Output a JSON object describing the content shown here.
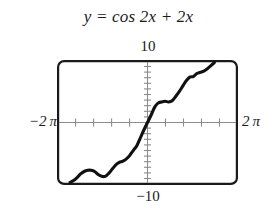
{
  "figure": {
    "equation_title": "y = cos 2x + 2x"
  },
  "labels": {
    "y_max": "10",
    "y_min": "−10",
    "x_min": "−2 π",
    "x_max": "2 π"
  },
  "colors": {
    "curve": "#111111",
    "frame": "#1a1a1a",
    "axis": "#8c8c8c",
    "background": "#ffffff",
    "text": "#1a1a1a"
  },
  "chart_data": {
    "type": "line",
    "title": "y = cos 2x + 2x",
    "xlabel": "",
    "ylabel": "",
    "xlim": [
      -6.283185,
      6.283185
    ],
    "ylim": [
      -10,
      10
    ],
    "xlim_label": [
      "−2π",
      "2π"
    ],
    "ylim_label": [
      "−10",
      "10"
    ],
    "grid": false,
    "legend": null,
    "axis_style": "calculator-viewing-window",
    "x_axis_ticks": 10,
    "y_axis_ticks": 20,
    "x_tick_spacing": 1.2566371,
    "y_tick_spacing": 1.0,
    "series": [
      {
        "name": "y = cos 2x + 2x",
        "expression": "cos(2x) + 2x",
        "color": "#111111",
        "x": [
          -5.5,
          -5.25,
          -5.0,
          -4.75,
          -4.5,
          -4.25,
          -4.0,
          -3.75,
          -3.5,
          -3.25,
          -3.0,
          -2.75,
          -2.5,
          -2.25,
          -2.0,
          -1.75,
          -1.5,
          -1.25,
          -1.0,
          -0.75,
          -0.5,
          -0.25,
          0.0,
          0.25,
          0.5,
          0.75,
          1.0,
          1.25,
          1.5,
          1.75,
          2.0,
          2.25,
          2.5,
          2.75,
          3.0,
          3.25,
          3.5,
          3.75,
          4.0,
          4.25,
          4.5,
          4.75,
          5.0,
          5.25,
          5.5,
          5.75,
          6.0,
          6.28
        ],
        "y": [
          -10.96,
          -10.0,
          -9.16,
          -8.52,
          -8.09,
          -7.85,
          -7.85,
          -8.11,
          -8.62,
          -9.3,
          -9.04,
          -8.4,
          -7.72,
          -7.04,
          -6.65,
          -6.44,
          -6.04,
          -5.42,
          -4.58,
          -3.77,
          -3.46,
          -3.38,
          1.0,
          1.38,
          0.54,
          -0.27,
          1.58,
          2.78,
          3.42,
          3.68,
          3.35,
          3.56,
          4.28,
          5.1,
          6.96,
          7.49,
          7.62,
          8.11,
          9.15,
          10.11,
          8.09,
          7.85,
          9.16,
          10.5,
          11.96,
          12.01,
          11.85,
          13.51
        ],
        "y_display": [
          -9.9,
          -9.6,
          -9.1,
          -8.5,
          -8.1,
          -7.9,
          -7.9,
          -8.1,
          -8.6,
          -8.9,
          -8.9,
          -8.4,
          -7.7,
          -7.0,
          -6.6,
          -6.4,
          -6.0,
          -5.4,
          -4.6,
          -3.8,
          -2.5,
          -1.2,
          0.0,
          1.2,
          2.5,
          3.2,
          3.4,
          3.5,
          3.4,
          3.6,
          4.3,
          5.1,
          6.0,
          6.9,
          7.5,
          7.6,
          8.1,
          8.3,
          8.5,
          8.9,
          9.4,
          9.9,
          10.0,
          10.0,
          10.0,
          10.0,
          10.0,
          10.0
        ]
      }
    ]
  }
}
